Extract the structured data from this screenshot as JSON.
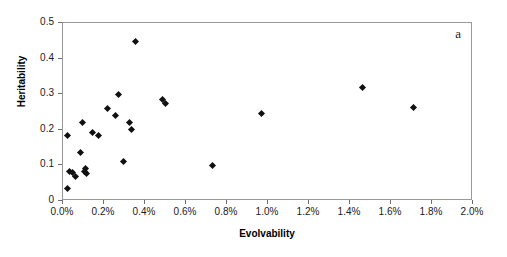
{
  "chart_data": {
    "type": "scatter",
    "title": "",
    "panel_label": "a",
    "xlabel": "Evolvability",
    "ylabel": "Heritability",
    "xlim": [
      0.0,
      2.0
    ],
    "ylim": [
      0.0,
      0.5
    ],
    "x_tick_labels": [
      "0.0%",
      "0.2%",
      "0.4%",
      "0.6%",
      "0.8%",
      "1.0%",
      "1.2%",
      "1.4%",
      "1.6%",
      "1.8%",
      "2.0%"
    ],
    "x_tick_values": [
      0.0,
      0.2,
      0.4,
      0.6,
      0.8,
      1.0,
      1.2,
      1.4,
      1.6,
      1.8,
      2.0
    ],
    "y_tick_labels": [
      "0",
      "0.1",
      "0.2",
      "0.3",
      "0.4",
      "0.5"
    ],
    "y_tick_values": [
      0.0,
      0.1,
      0.2,
      0.3,
      0.4,
      0.5
    ],
    "x_unit": "percent",
    "grid": false,
    "legend": "none",
    "marker": "diamond",
    "marker_color": "#111111",
    "series": [
      {
        "name": "populations",
        "points": [
          {
            "x": 0.02,
            "y": 0.035
          },
          {
            "x": 0.02,
            "y": 0.185
          },
          {
            "x": 0.03,
            "y": 0.082
          },
          {
            "x": 0.045,
            "y": 0.08
          },
          {
            "x": 0.06,
            "y": 0.07
          },
          {
            "x": 0.085,
            "y": 0.135
          },
          {
            "x": 0.095,
            "y": 0.22
          },
          {
            "x": 0.105,
            "y": 0.082
          },
          {
            "x": 0.11,
            "y": 0.09
          },
          {
            "x": 0.115,
            "y": 0.078
          },
          {
            "x": 0.145,
            "y": 0.192
          },
          {
            "x": 0.175,
            "y": 0.185
          },
          {
            "x": 0.215,
            "y": 0.26
          },
          {
            "x": 0.255,
            "y": 0.24
          },
          {
            "x": 0.27,
            "y": 0.3
          },
          {
            "x": 0.295,
            "y": 0.11
          },
          {
            "x": 0.325,
            "y": 0.22
          },
          {
            "x": 0.335,
            "y": 0.2
          },
          {
            "x": 0.355,
            "y": 0.447
          },
          {
            "x": 0.485,
            "y": 0.285
          },
          {
            "x": 0.5,
            "y": 0.273
          },
          {
            "x": 0.73,
            "y": 0.1
          },
          {
            "x": 0.97,
            "y": 0.245
          },
          {
            "x": 1.46,
            "y": 0.318
          },
          {
            "x": 1.71,
            "y": 0.262
          }
        ]
      }
    ]
  }
}
